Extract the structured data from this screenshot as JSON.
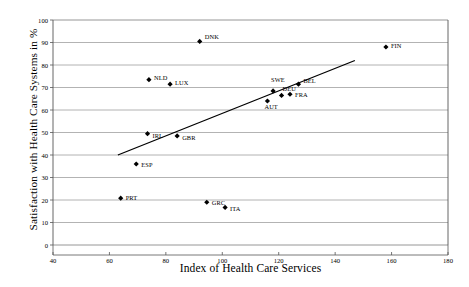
{
  "chart_data": {
    "type": "scatter",
    "title": "",
    "xlabel": "Index of Health Care Services",
    "ylabel": "Satisfaction with Health Care Systems in %",
    "xlim": [
      40,
      180
    ],
    "ylim": [
      0,
      100
    ],
    "xticks": [
      40,
      60,
      80,
      100,
      120,
      140,
      160,
      180
    ],
    "yticks": [
      0,
      10,
      20,
      30,
      40,
      50,
      60,
      70,
      80,
      90,
      100
    ],
    "grid": "horizontal",
    "legend": "none",
    "marker": "filled-diamond",
    "marker_color": "#000000",
    "points": [
      {
        "label": "DNK",
        "x": 92,
        "y": 90.5,
        "label_dx": 5,
        "label_dy": -5
      },
      {
        "label": "FIN",
        "x": 158,
        "y": 88,
        "label_dx": 5,
        "label_dy": -2
      },
      {
        "label": "NLD",
        "x": 74,
        "y": 73.5,
        "label_dx": 5,
        "label_dy": -2
      },
      {
        "label": "LUX",
        "x": 81.5,
        "y": 71.5,
        "label_dx": 5,
        "label_dy": -2
      },
      {
        "label": "BEL",
        "x": 127,
        "y": 71.5,
        "label_dx": 5,
        "label_dy": -4
      },
      {
        "label": "SWE",
        "x": 118,
        "y": 68.5,
        "label_dx": -2,
        "label_dy": -11
      },
      {
        "label": "DEU",
        "x": 121,
        "y": 66.5,
        "label_dx": 1,
        "label_dy": -7
      },
      {
        "label": "FRA",
        "x": 124,
        "y": 67,
        "label_dx": 5,
        "label_dy": 0
      },
      {
        "label": "AUT",
        "x": 116,
        "y": 64,
        "label_dx": -3,
        "label_dy": 5
      },
      {
        "label": "IRL",
        "x": 73.5,
        "y": 49.5,
        "label_dx": 5,
        "label_dy": 2
      },
      {
        "label": "GBR",
        "x": 84,
        "y": 48.5,
        "label_dx": 5,
        "label_dy": 2
      },
      {
        "label": "ESP",
        "x": 69.5,
        "y": 36,
        "label_dx": 5,
        "label_dy": 0
      },
      {
        "label": "PRT",
        "x": 64,
        "y": 20.8,
        "label_dx": 5,
        "label_dy": -1
      },
      {
        "label": "GRC",
        "x": 94.5,
        "y": 19,
        "label_dx": 5,
        "label_dy": 0
      },
      {
        "label": "ITA",
        "x": 101,
        "y": 16.7,
        "label_dx": 5,
        "label_dy": 1
      }
    ],
    "trendline": {
      "x1": 63,
      "y1": 40,
      "x2": 147,
      "y2": 82
    }
  }
}
